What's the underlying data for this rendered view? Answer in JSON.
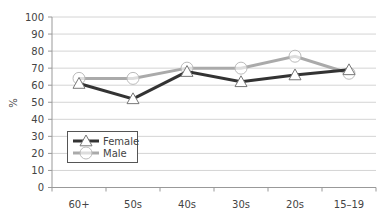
{
  "chart_data": {
    "type": "line",
    "title": "",
    "xlabel": "",
    "ylabel": "%",
    "ylim": [
      0,
      100
    ],
    "yticks": [
      0,
      10,
      20,
      30,
      40,
      50,
      60,
      70,
      80,
      90,
      100
    ],
    "grid": true,
    "legend_position": "lower-left inside",
    "categories": [
      "60+",
      "50s",
      "40s",
      "30s",
      "20s",
      "15–19"
    ],
    "series": [
      {
        "name": "Female",
        "color": "#333333",
        "marker": "triangle",
        "values": [
          61,
          52,
          68,
          62,
          66,
          69
        ]
      },
      {
        "name": "Male",
        "color": "#aaaaaa",
        "marker": "circle",
        "values": [
          64,
          64,
          70,
          70,
          77,
          67
        ]
      }
    ]
  }
}
